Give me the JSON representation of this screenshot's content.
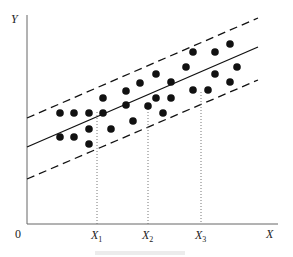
{
  "diagram": {
    "type": "scatter-with-regression-band",
    "axes": {
      "y_label": "Y",
      "x_label": "X",
      "origin_label": "0"
    },
    "x_markers": [
      {
        "label": "X",
        "sub": "1",
        "x": 97,
        "top": 112
      },
      {
        "label": "X",
        "sub": "2",
        "x": 148,
        "top": 106
      },
      {
        "label": "X",
        "sub": "3",
        "x": 201,
        "top": 92
      }
    ],
    "lines": {
      "regression": {
        "style": "solid",
        "x1": 27,
        "y1": 147,
        "x2": 258,
        "y2": 47
      },
      "upper_bound": {
        "style": "dashed",
        "x1": 27,
        "y1": 118,
        "x2": 258,
        "y2": 18
      },
      "lower_bound": {
        "style": "dashed",
        "x1": 27,
        "y1": 179,
        "x2": 258,
        "y2": 80
      }
    },
    "points": [
      [
        60,
        113
      ],
      [
        74,
        113
      ],
      [
        89,
        113
      ],
      [
        103,
        113
      ],
      [
        103,
        98
      ],
      [
        126,
        91
      ],
      [
        126,
        105
      ],
      [
        140,
        83
      ],
      [
        60,
        137
      ],
      [
        74,
        137
      ],
      [
        89,
        129
      ],
      [
        89,
        144
      ],
      [
        111,
        129
      ],
      [
        133,
        121
      ],
      [
        156,
        74
      ],
      [
        171,
        82
      ],
      [
        186,
        67
      ],
      [
        193,
        52
      ],
      [
        215,
        52
      ],
      [
        230,
        44
      ],
      [
        237,
        67
      ],
      [
        215,
        74
      ],
      [
        230,
        82
      ],
      [
        193,
        90
      ],
      [
        208,
        90
      ],
      [
        148,
        106
      ],
      [
        156,
        98
      ],
      [
        171,
        98
      ],
      [
        163,
        113
      ]
    ],
    "colors": {
      "ink": "#111111",
      "axis": "#555555",
      "caption": "#e6e6e6"
    }
  }
}
